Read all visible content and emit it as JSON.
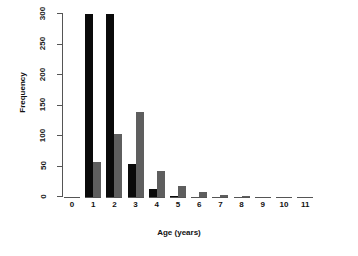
{
  "chart_data": {
    "type": "bar",
    "title": "",
    "subtitle": "",
    "xlabel": "Age (years)",
    "ylabel": "Frequency",
    "categories": [
      "0",
      "1",
      "2",
      "3",
      "4",
      "5",
      "6",
      "7",
      "8",
      "9",
      "10",
      "11"
    ],
    "xtick_labels": [
      "0",
      "1",
      "2",
      "3",
      "4",
      "5",
      "6",
      "7",
      "8",
      "9",
      "10",
      "11"
    ],
    "ytick_labels": [
      "0",
      "50",
      "100",
      "150",
      "200",
      "250",
      "300"
    ],
    "ytick_values": [
      0,
      50,
      100,
      150,
      200,
      250,
      300
    ],
    "ylim": [
      0,
      300
    ],
    "grid": false,
    "legend": "none",
    "note": "Bars for ages 1 and 2 in the black series are clipped at the top of the axis (values exceed 300).",
    "series": [
      {
        "name": "series-black",
        "color": "#0a0a0a",
        "values": [
          0,
          318,
          318,
          54,
          13,
          2,
          0,
          0,
          0,
          0,
          0,
          0
        ]
      },
      {
        "name": "series-gray",
        "color": "#5e5e5e",
        "values": [
          0,
          58,
          103,
          140,
          42,
          18,
          9,
          3,
          1,
          0,
          0,
          0
        ]
      }
    ]
  },
  "axes": {
    "y_title": "Frequency",
    "x_title": "Age (years)"
  }
}
